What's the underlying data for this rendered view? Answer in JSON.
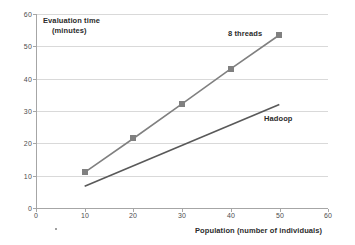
{
  "chart_data": {
    "type": "line",
    "title": "",
    "xlabel": "Population (number of individuals)",
    "ylabel_line1": "Evaluation time",
    "ylabel_line2": "(minutes)",
    "xlim": [
      0,
      60
    ],
    "ylim": [
      0,
      60
    ],
    "xticks": [
      0,
      10,
      20,
      30,
      40,
      50,
      60
    ],
    "yticks": [
      0,
      10,
      20,
      30,
      40,
      50,
      60
    ],
    "grid": "horizontal",
    "legend_position": "inline-annotation",
    "series": [
      {
        "name": "8 threads",
        "label": "8 threads",
        "color": "#808080",
        "marker": "square",
        "x": [
          10,
          20,
          30,
          40,
          50
        ],
        "values": [
          11,
          21.5,
          32.2,
          43,
          53.5
        ]
      },
      {
        "name": "Hadoop",
        "label": "Hadoop",
        "color": "#595959",
        "marker": "none",
        "x": [
          10,
          50
        ],
        "values": [
          6.7,
          32
        ]
      }
    ]
  },
  "axes": {
    "y_tick_labels": [
      "60",
      "50",
      "40",
      "30",
      "20",
      "10",
      "0"
    ],
    "x_tick_labels": [
      "0",
      "10",
      "20",
      "30",
      "40",
      "50",
      "60"
    ]
  },
  "colors": {
    "grid": "#d9d9d9",
    "axis": "#a6a6a6",
    "text": "#2b2b2b",
    "tick_text": "#4d4d4d",
    "series_threads": "#808080",
    "series_hadoop": "#595959",
    "background": "#ffffff"
  }
}
